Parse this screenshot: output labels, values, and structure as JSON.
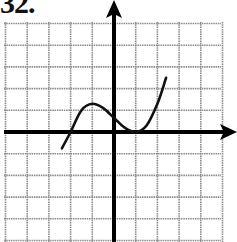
{
  "problem": {
    "label": "32."
  },
  "chart_data": {
    "type": "line",
    "title": "",
    "xlabel": "",
    "ylabel": "",
    "grid": true,
    "xlim": [
      -5,
      5
    ],
    "ylim": [
      -5,
      5
    ],
    "grid_step": 1,
    "series": [
      {
        "name": "f(x)",
        "x": [
          -2.4,
          -2.0,
          -1.5,
          -1.0,
          -0.5,
          0.0,
          0.5,
          1.0,
          1.5,
          2.0,
          2.4
        ],
        "y": [
          -0.75,
          0.0,
          1.0,
          1.3,
          1.1,
          0.65,
          0.2,
          0.0,
          0.3,
          1.3,
          2.5
        ]
      }
    ],
    "annotations": [
      "x-intercept at x=-2",
      "local max near (-1, 1.3)",
      "touches x-axis at x=1"
    ],
    "colors": {
      "grid": "#8a8a8a",
      "axes": "#000000",
      "curve": "#111111"
    }
  }
}
